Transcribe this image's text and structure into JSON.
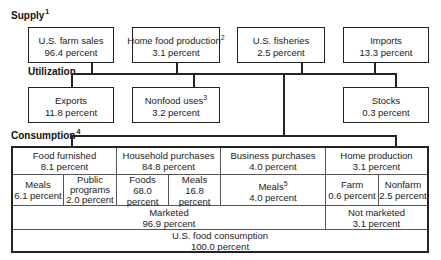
{
  "supply": {
    "label": "Supply",
    "footnote": "1",
    "items": [
      {
        "name": "U.S. farm sales",
        "value": "96.4 percent",
        "footnote": ""
      },
      {
        "name": "Home food production",
        "value": "3.1 percent",
        "footnote": "2"
      },
      {
        "name": "U.S. fisheries",
        "value": "2.5 percent",
        "footnote": ""
      },
      {
        "name": "Imports",
        "value": "13.3 percent",
        "footnote": ""
      }
    ]
  },
  "utilization": {
    "label": "Utilization",
    "items": [
      {
        "name": "Exports",
        "value": "11.8 percent",
        "footnote": ""
      },
      {
        "name": "Nonfood uses",
        "value": "3.2 percent",
        "footnote": "3"
      },
      {
        "name": "Stocks",
        "value": "0.3 percent",
        "footnote": ""
      }
    ]
  },
  "consumption": {
    "label": "Consumption",
    "footnote": "4",
    "categories": [
      {
        "name": "Food furnished",
        "value": "8.1 percent"
      },
      {
        "name": "Household purchases",
        "value": "84.8 percent"
      },
      {
        "name": "Business purchases",
        "value": "4.0 percent"
      },
      {
        "name": "Home production",
        "value": "3.1 percent"
      }
    ],
    "subcategories": [
      {
        "name": "Meals",
        "value": "6.1 percent",
        "footnote": ""
      },
      {
        "name": "Public programs",
        "value": "2.0 percent",
        "footnote": ""
      },
      {
        "name": "Foods",
        "value": "68.0 percent",
        "footnote": ""
      },
      {
        "name": "Meals",
        "value": "16.8 percent",
        "footnote": ""
      },
      {
        "name": "Meals",
        "value": "4.0 percent",
        "footnote": "5"
      },
      {
        "name": "Farm",
        "value": "0.6 percent",
        "footnote": ""
      },
      {
        "name": "Nonfarm",
        "value": "2.5 percent",
        "footnote": ""
      }
    ],
    "market": [
      {
        "name": "Marketed",
        "value": "96.9 percent"
      },
      {
        "name": "Not marketed",
        "value": "3.1 percent"
      }
    ],
    "total": {
      "name": "U.S. food consumption",
      "value": "100.0 percent"
    }
  }
}
